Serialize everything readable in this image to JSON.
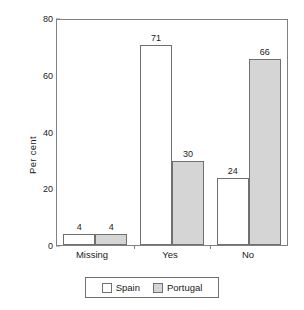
{
  "chart_data": {
    "type": "bar",
    "title": "",
    "xlabel": "",
    "ylabel": "Per cent",
    "ylim": [
      0,
      80
    ],
    "yticks": [
      0,
      20,
      40,
      60,
      80
    ],
    "grid": false,
    "legend_position": "bottom",
    "categories": [
      "Missing",
      "Yes",
      "No"
    ],
    "series": [
      {
        "name": "Spain",
        "color": "#ffffff",
        "values": [
          4,
          71,
          24
        ]
      },
      {
        "name": "Portugal",
        "color": "#d5d5d5",
        "values": [
          4,
          30,
          66
        ]
      }
    ],
    "data_labels": {
      "Missing": {
        "Spain": "4",
        "Portugal": "4"
      },
      "Yes": {
        "Spain": "71",
        "Portugal": "30"
      },
      "No": {
        "Spain": "24",
        "Portugal": "66"
      }
    }
  },
  "axis": {
    "y_title": "Per cent",
    "y_tick_labels": [
      "80",
      "60",
      "40",
      "20",
      "0"
    ],
    "x_tick_labels": [
      "Missing",
      "Yes",
      "No"
    ]
  },
  "legend": {
    "entries": [
      {
        "label": "Spain"
      },
      {
        "label": "Portugal"
      }
    ]
  }
}
